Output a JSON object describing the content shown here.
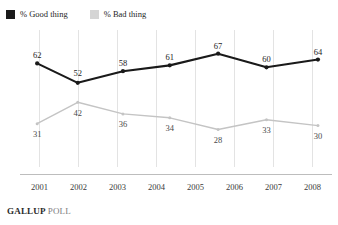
{
  "legend": {
    "items": [
      {
        "label": "% Good thing",
        "key": "good",
        "color": "#1a1a1a",
        "icon": "legend-swatch-icon"
      },
      {
        "label": "% Bad thing",
        "key": "bad",
        "color": "#d5d5d5",
        "icon": "legend-swatch-icon"
      }
    ]
  },
  "footer": {
    "brand": "GALLUP",
    "kind": "POLL"
  },
  "chart_data": {
    "type": "line",
    "title": "",
    "subtitle": "",
    "xlabel": "",
    "ylabel": "",
    "grid": "vertical",
    "legend_position": "top-left",
    "ylim": [
      20,
      72
    ],
    "x_ticks": [
      "2001",
      "2002",
      "2003",
      "2004",
      "2005",
      "2006",
      "2007",
      "2008"
    ],
    "x": [
      "2001",
      "2002",
      "2003",
      "2004",
      "2005",
      "2006",
      "2007"
    ],
    "x_positions": [
      0.055,
      0.185,
      0.33,
      0.48,
      0.635,
      0.79,
      0.955
    ],
    "series": [
      {
        "name": "% Good thing",
        "key": "good",
        "color": "#1a1a1a",
        "values": [
          62,
          52,
          58,
          61,
          67,
          60,
          64
        ],
        "label_offsets": [
          "above",
          "above",
          "above",
          "above",
          "above",
          "above",
          "above"
        ]
      },
      {
        "name": "% Bad thing",
        "key": "bad",
        "color": "#c4c4c4",
        "values": [
          31,
          42,
          36,
          34,
          28,
          33,
          30
        ],
        "label_offsets": [
          "below",
          "below",
          "below",
          "below",
          "below",
          "below",
          "below"
        ]
      }
    ]
  }
}
